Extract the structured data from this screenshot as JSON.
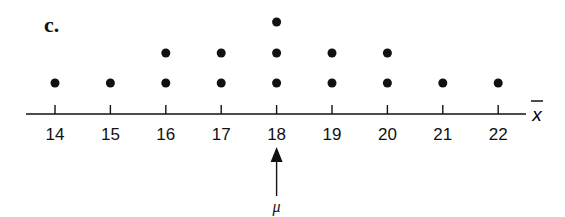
{
  "panel_label": "c.",
  "chart_data": {
    "type": "scatter",
    "subtype": "dot_plot",
    "title": "",
    "xlabel": "x̄",
    "ylabel": "",
    "categories": [
      "14",
      "15",
      "16",
      "17",
      "18",
      "19",
      "20",
      "21",
      "22"
    ],
    "x": [
      14,
      15,
      16,
      17,
      18,
      19,
      20,
      21,
      22
    ],
    "counts": [
      1,
      1,
      2,
      2,
      3,
      2,
      2,
      1,
      1
    ],
    "xlim": [
      13.5,
      22.5
    ],
    "grid": false,
    "legend": null,
    "annotations": [
      {
        "type": "arrow",
        "x": 18,
        "direction": "up",
        "label": "μ"
      }
    ]
  },
  "colors": {
    "ink": "#111111",
    "background": "#ffffff"
  }
}
